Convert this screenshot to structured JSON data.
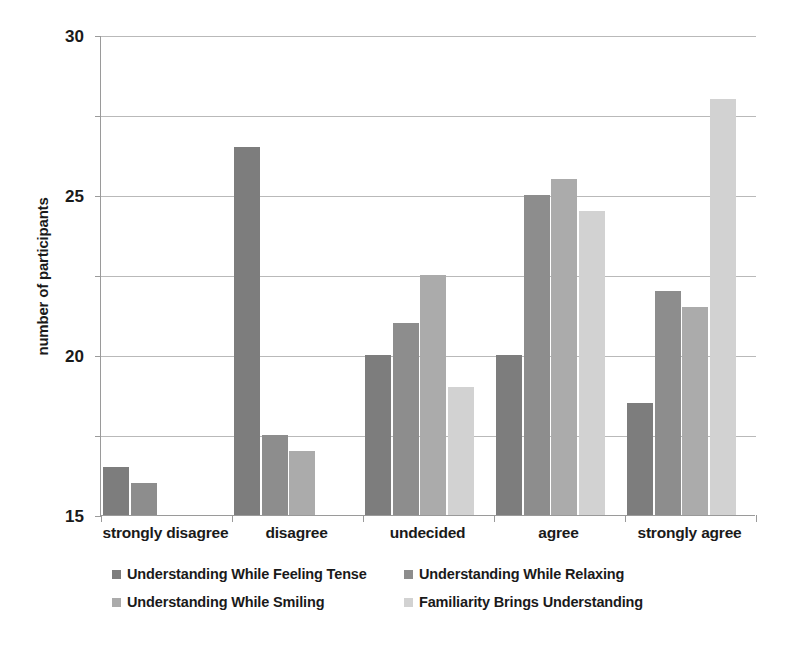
{
  "chart_data": {
    "type": "bar",
    "title": "",
    "xlabel": "",
    "ylabel": "number of participants",
    "ylim": [
      0,
      30
    ],
    "yticks": [
      0,
      5,
      10,
      15,
      20,
      25,
      30
    ],
    "grid": true,
    "legend_position": "bottom",
    "categories": [
      "strongly disagree",
      "disagree",
      "undecided",
      "agree",
      "strongly agree"
    ],
    "series": [
      {
        "name": "Understanding While Feeling Tense",
        "color": "#7d7d7d",
        "values": [
          3,
          23,
          10,
          10,
          7
        ]
      },
      {
        "name": "Understanding While Relaxing",
        "color": "#8d8d8d",
        "values": [
          2,
          5,
          12,
          20,
          14
        ]
      },
      {
        "name": "Understanding While Smiling",
        "color": "#ababab",
        "values": [
          0,
          4,
          15,
          21,
          13
        ]
      },
      {
        "name": "Familiarity Brings Understanding",
        "color": "#d2d2d2",
        "values": [
          0,
          0,
          8,
          19,
          26
        ]
      }
    ]
  },
  "axis": {
    "y_title": "number of participants",
    "y_tick_labels": [
      "30",
      "25",
      "20",
      "15",
      "10",
      "5",
      "0"
    ],
    "x_tick_labels": [
      "strongly disagree",
      "disagree",
      "undecided",
      "agree",
      "strongly agree"
    ]
  },
  "legend": {
    "rows": [
      [
        {
          "label": "Understanding While Feeling Tense",
          "color": "#7d7d7d"
        },
        {
          "label": "Understanding While Relaxing",
          "color": "#8d8d8d"
        }
      ],
      [
        {
          "label": "Understanding While Smiling",
          "color": "#ababab"
        },
        {
          "label": "Familiarity Brings Understanding",
          "color": "#d2d2d2"
        }
      ]
    ]
  },
  "style": {
    "gridline_color": "#b9b9b9",
    "axis_color": "#9a9a9a",
    "text_color": "#1a1a1a",
    "background": "#ffffff"
  }
}
